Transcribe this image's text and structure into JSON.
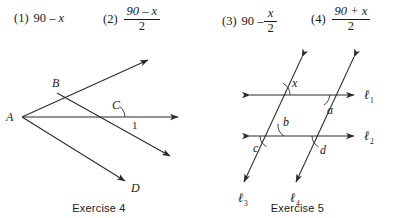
{
  "choices": [
    {
      "num": "(1)",
      "kind": "inline",
      "text": "90 – x",
      "parts": [
        {
          "t": "90 – ",
          "italic": false
        },
        {
          "t": "x",
          "italic": true
        }
      ]
    },
    {
      "num": "(2)",
      "kind": "fraction",
      "numerator": "90 – x",
      "denominator": "2"
    },
    {
      "num": "(3)",
      "kind": "mixed",
      "lead": "90 – ",
      "numerator": "x",
      "denominator": "2"
    },
    {
      "num": "(4)",
      "kind": "fraction",
      "numerator": "90 + x",
      "denominator": "2"
    }
  ],
  "figure4": {
    "caption": "Exercise 4",
    "points": {
      "A": "A",
      "B": "B",
      "C": "C",
      "D": "D"
    },
    "angle_label": "1"
  },
  "figure5": {
    "caption": "Exercise 5",
    "angles": {
      "x": "x",
      "a": "a",
      "b": "b",
      "c": "c",
      "d": "d"
    },
    "lines": {
      "l1": {
        "base": "ℓ",
        "sub": "1"
      },
      "l2": {
        "base": "ℓ",
        "sub": "2"
      },
      "l3": {
        "base": "ℓ",
        "sub": "3"
      },
      "l4": {
        "base": "ℓ",
        "sub": "4"
      }
    }
  },
  "colors": {
    "ink": "#1a1a1a",
    "stroke": "#2b2b2b",
    "background": "#ffffff"
  }
}
